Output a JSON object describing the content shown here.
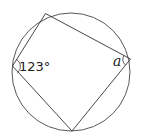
{
  "diagram": {
    "type": "cyclic-quadrilateral",
    "circle": {
      "cx": 71,
      "cy": 72,
      "r": 59
    },
    "vertices": {
      "top": [
        45.5,
        13.5
      ],
      "right": [
        130.5,
        59
      ],
      "bottom": [
        72,
        131
      ],
      "left": [
        12.5,
        66
      ]
    },
    "angle_labels": {
      "left": "123°",
      "right": "a"
    },
    "colors": {
      "stroke": "#333333",
      "background": "#ffffff"
    }
  }
}
